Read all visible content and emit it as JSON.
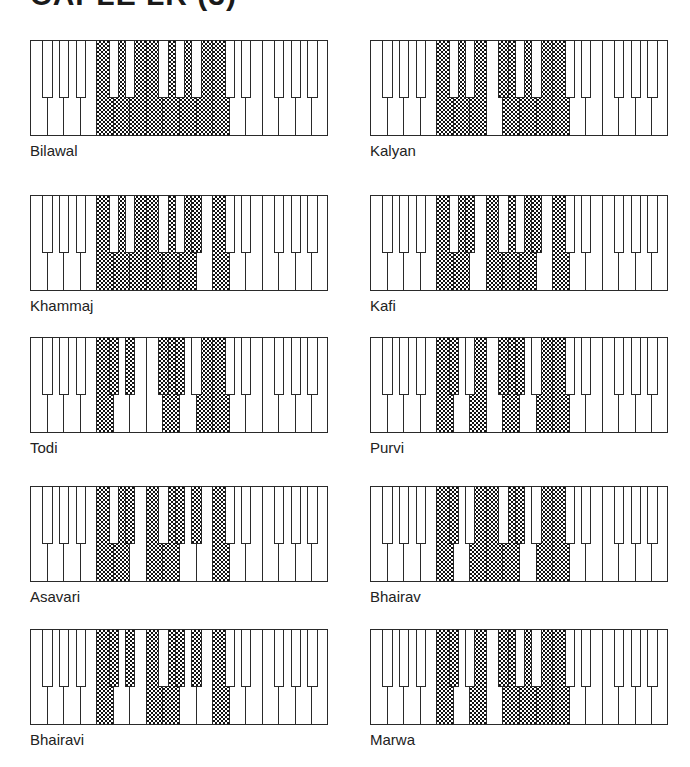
{
  "title": "CAPLE LR (3)",
  "keyboard": {
    "white_keys": [
      "F",
      "G",
      "A",
      "B",
      "C",
      "D",
      "E",
      "F",
      "G",
      "A",
      "B",
      "C",
      "D",
      "E",
      "F",
      "G",
      "A",
      "B"
    ],
    "black_keys": [
      {
        "name": "F#",
        "after_white": 0
      },
      {
        "name": "G#",
        "after_white": 1
      },
      {
        "name": "A#",
        "after_white": 2
      },
      {
        "name": "C#",
        "after_white": 4
      },
      {
        "name": "D#",
        "after_white": 5
      },
      {
        "name": "F#",
        "after_white": 7
      },
      {
        "name": "G#",
        "after_white": 8
      },
      {
        "name": "A#",
        "after_white": 9
      },
      {
        "name": "C#",
        "after_white": 11
      },
      {
        "name": "D#",
        "after_white": 12
      },
      {
        "name": "F#",
        "after_white": 14
      },
      {
        "name": "G#",
        "after_white": 15
      },
      {
        "name": "A#",
        "after_white": 16
      }
    ]
  },
  "thaats": [
    {
      "name": "Bilawal",
      "shaded_white": [
        4,
        5,
        6,
        7,
        8,
        9,
        10,
        11
      ],
      "shaded_black": []
    },
    {
      "name": "Kalyan",
      "shaded_white": [
        4,
        5,
        6,
        8,
        9,
        10,
        11
      ],
      "shaded_black": [
        5
      ]
    },
    {
      "name": "Khammaj",
      "shaded_white": [
        4,
        5,
        6,
        7,
        8,
        9,
        11
      ],
      "shaded_black": [
        7
      ]
    },
    {
      "name": "Kafi",
      "shaded_white": [
        4,
        5,
        7,
        8,
        9,
        11
      ],
      "shaded_black": [
        4,
        7
      ]
    },
    {
      "name": "Todi",
      "shaded_white": [
        4,
        8,
        10,
        11
      ],
      "shaded_black": [
        3,
        4,
        5,
        6
      ]
    },
    {
      "name": "Purvi",
      "shaded_white": [
        4,
        6,
        8,
        10,
        11
      ],
      "shaded_black": [
        3,
        5,
        6
      ]
    },
    {
      "name": "Asavari",
      "shaded_white": [
        4,
        5,
        7,
        8,
        11
      ],
      "shaded_black": [
        4,
        6,
        7
      ]
    },
    {
      "name": "Bhairav",
      "shaded_white": [
        4,
        6,
        7,
        8,
        10,
        11
      ],
      "shaded_black": [
        3,
        6
      ]
    },
    {
      "name": "Bhairavi",
      "shaded_white": [
        4,
        7,
        8,
        11
      ],
      "shaded_black": [
        3,
        4,
        6,
        7
      ]
    },
    {
      "name": "Marwa",
      "shaded_white": [
        4,
        6,
        8,
        9,
        10,
        11
      ],
      "shaded_black": [
        3,
        5
      ]
    }
  ],
  "layout": {
    "columns_x": [
      30,
      370
    ],
    "rows_y": [
      40,
      195,
      337,
      486,
      629
    ]
  },
  "colors": {
    "ink": "#1a1a1a",
    "background": "#ffffff"
  }
}
